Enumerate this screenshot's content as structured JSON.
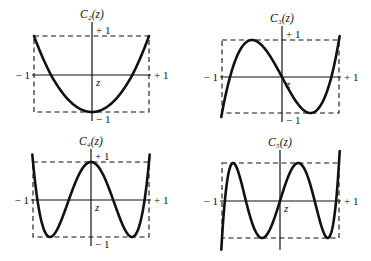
{
  "figure": {
    "panels": [
      {
        "id": "c2",
        "title": "C₂(z)",
        "order": 2,
        "labels": {
          "left": "− 1",
          "right": "+ 1",
          "top": "+ 1",
          "bottom": "− 1",
          "axis": "z"
        },
        "box": {
          "left": 34,
          "right": 149,
          "top": 36,
          "bottom": 112
        },
        "origin": {
          "x": 92,
          "y": 75
        },
        "vaxis": {
          "top": 22,
          "bottom": 121
        },
        "show_bottom_label": true
      },
      {
        "id": "c3",
        "title": "C₃(z)",
        "order": 3,
        "labels": {
          "left": "− 1",
          "right": "+ 1",
          "top": "+ 1",
          "bottom": "− 1",
          "axis": "z"
        },
        "box": {
          "left": 222,
          "right": 339,
          "top": 40,
          "bottom": 113
        },
        "origin": {
          "x": 282,
          "y": 77
        },
        "vaxis": {
          "top": 26,
          "bottom": 122
        },
        "show_bottom_label": true
      },
      {
        "id": "c4",
        "title": "C₄(z)",
        "order": 4,
        "labels": {
          "left": "− 1",
          "right": "+ 1",
          "top": "+ 1",
          "bottom": "− 1",
          "axis": "z"
        },
        "box": {
          "left": 33,
          "right": 149,
          "top": 162,
          "bottom": 237
        },
        "origin": {
          "x": 91,
          "y": 200
        },
        "vaxis": {
          "top": 149,
          "bottom": 246
        },
        "show_bottom_label": true
      },
      {
        "id": "c5",
        "title": "C₅(z)",
        "order": 5,
        "labels": {
          "left": "− 1",
          "right": "+ 1",
          "top": "",
          "bottom": "",
          "axis": "z"
        },
        "box": {
          "left": 222,
          "right": 339,
          "top": 163,
          "bottom": 238
        },
        "origin": {
          "x": 280,
          "y": 201
        },
        "vaxis": {
          "top": 150,
          "bottom": 250
        },
        "show_bottom_label": false
      }
    ]
  },
  "chart_data": [
    {
      "type": "line",
      "title": "C2(z)",
      "function": "Chebyshev polynomial T2(z) = 2z^2 - 1",
      "xlabel": "z",
      "xlim": [
        -1,
        1
      ],
      "ylim": [
        -1,
        1
      ],
      "x": [
        -1,
        -0.5,
        0,
        0.5,
        1
      ],
      "y": [
        1,
        -0.5,
        -1,
        -0.5,
        1
      ]
    },
    {
      "type": "line",
      "title": "C3(z)",
      "function": "T3(z) = 4z^3 - 3z",
      "xlabel": "z",
      "xlim": [
        -1,
        1
      ],
      "ylim": [
        -1,
        1
      ],
      "x": [
        -1,
        -0.5,
        0,
        0.5,
        1
      ],
      "y": [
        -1,
        1,
        0,
        -1,
        1
      ]
    },
    {
      "type": "line",
      "title": "C4(z)",
      "function": "T4(z) = 8z^4 - 8z^2 + 1",
      "xlabel": "z",
      "xlim": [
        -1,
        1
      ],
      "ylim": [
        -1,
        1
      ],
      "x": [
        -1,
        -0.707,
        0,
        0.707,
        1
      ],
      "y": [
        1,
        -1,
        1,
        -1,
        1
      ]
    },
    {
      "type": "line",
      "title": "C5(z)",
      "function": "T5(z) = 16z^5 - 20z^3 + 5z",
      "xlabel": "z",
      "xlim": [
        -1,
        1
      ],
      "ylim": [
        -1,
        1
      ],
      "x": [
        -1,
        -0.809,
        -0.309,
        0,
        0.309,
        0.809,
        1
      ],
      "y": [
        -1,
        1,
        -1,
        0,
        1,
        -1,
        1
      ]
    }
  ]
}
